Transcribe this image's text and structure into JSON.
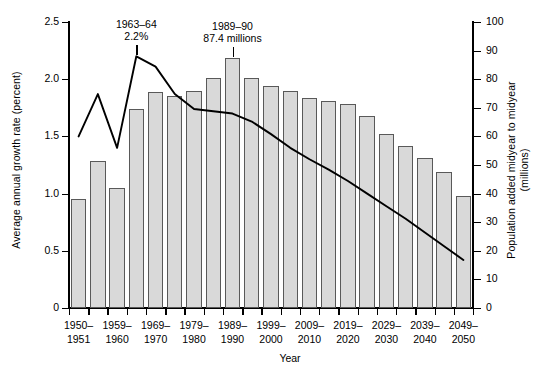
{
  "chart_data": {
    "type": "bar",
    "title": "",
    "xlabel": "Year",
    "ylabel": "Average annual growth rate (percent)",
    "y2label": "Population added midyear to midyear (millions)",
    "grid": false,
    "legend_position": "none",
    "ylim": [
      0,
      2.5
    ],
    "y2lim": [
      0,
      100
    ],
    "yticks": [
      "0",
      "0.5",
      "1.0",
      "1.5",
      "2.0",
      "2.5"
    ],
    "ytick_values": [
      0,
      0.5,
      1.0,
      1.5,
      2.0,
      2.5
    ],
    "y2ticks": [
      "0",
      "10",
      "20",
      "30",
      "40",
      "50",
      "60",
      "70",
      "80",
      "90",
      "100"
    ],
    "y2tick_values": [
      0,
      10,
      20,
      30,
      40,
      50,
      60,
      70,
      80,
      90,
      100
    ],
    "xtick_labels": [
      {
        "top": "1950–",
        "bottom": "1951"
      },
      {
        "top": "1959–",
        "bottom": "1960"
      },
      {
        "top": "1969–",
        "bottom": "1970"
      },
      {
        "top": "1979–",
        "bottom": "1980"
      },
      {
        "top": "1989–",
        "bottom": "1990"
      },
      {
        "top": "1999–",
        "bottom": "2000"
      },
      {
        "top": "2009–",
        "bottom": "2010"
      },
      {
        "top": "2019–",
        "bottom": "2020"
      },
      {
        "top": "2029–",
        "bottom": "2030"
      },
      {
        "top": "2039–",
        "bottom": "2040"
      },
      {
        "top": "2049–",
        "bottom": "2050"
      }
    ],
    "xtick_index": [
      0,
      2,
      4,
      6,
      8,
      10,
      12,
      14,
      16,
      18,
      20
    ],
    "categories": [
      "1950-1951",
      "1955-1956",
      "1959-1960",
      "1964-1965",
      "1969-1970",
      "1974-1975",
      "1979-1980",
      "1984-1985",
      "1989-1990",
      "1994-1995",
      "1999-2000",
      "2004-2005",
      "2009-2010",
      "2014-2015",
      "2019-2020",
      "2024-2025",
      "2029-2030",
      "2034-2035",
      "2039-2040",
      "2044-2045",
      "2049-2050"
    ],
    "series": [
      {
        "name": "Population added midyear to midyear (millions)",
        "type": "bar",
        "axis": "right",
        "units": "millions",
        "color": "#d9d9d9",
        "edge_color": "#595959",
        "values": [
          38.0,
          51.5,
          42.0,
          69.5,
          75.5,
          74.0,
          76.0,
          80.5,
          87.4,
          80.5,
          77.5,
          76.0,
          73.5,
          72.5,
          71.5,
          67.0,
          61.0,
          56.5,
          52.5,
          47.5,
          39.0
        ]
      },
      {
        "name": "Average annual growth rate (percent)",
        "type": "line",
        "axis": "left",
        "units": "percent",
        "color": "#000000",
        "values": [
          1.5,
          1.87,
          1.4,
          2.2,
          2.11,
          1.87,
          1.74,
          1.72,
          1.7,
          1.63,
          1.52,
          1.4,
          1.3,
          1.21,
          1.11,
          1.0,
          0.89,
          0.78,
          0.66,
          0.54,
          0.42
        ]
      }
    ],
    "annotations": [
      {
        "name": "peak-growth-rate",
        "line1": "1963–64",
        "line2": "2.2%",
        "target_index": 3
      },
      {
        "name": "peak-population-added",
        "line1": "1989–90",
        "line2": "87.4 millions",
        "target_index": 8
      }
    ]
  }
}
